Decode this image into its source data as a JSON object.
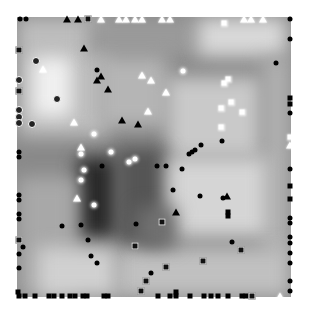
{
  "figure": {
    "plot_area": {
      "left": 17,
      "top": 17,
      "width": 274,
      "height": 280
    },
    "background_regions": [
      {
        "x": 0,
        "y": 0,
        "w": 90,
        "h": 120,
        "shade": "#bdbdbd"
      },
      {
        "x": 15,
        "y": 40,
        "w": 40,
        "h": 60,
        "shade": "#f0f0f0"
      },
      {
        "x": 70,
        "y": 0,
        "w": 110,
        "h": 40,
        "shade": "#9a9a9a"
      },
      {
        "x": 180,
        "y": 0,
        "w": 90,
        "h": 40,
        "shade": "#d8d8d8"
      },
      {
        "x": 80,
        "y": 40,
        "w": 70,
        "h": 70,
        "shade": "#b5b5b5"
      },
      {
        "x": 150,
        "y": 60,
        "w": 95,
        "h": 80,
        "shade": "#c9c9c9"
      },
      {
        "x": 245,
        "y": 40,
        "w": 29,
        "h": 200,
        "shade": "#b0b0b0"
      },
      {
        "x": 60,
        "y": 140,
        "w": 40,
        "h": 80,
        "shade": "#2a2a2a"
      },
      {
        "x": 100,
        "y": 130,
        "w": 50,
        "h": 110,
        "shade": "#555555"
      },
      {
        "x": 150,
        "y": 140,
        "w": 100,
        "h": 80,
        "shade": "#d5d5d5"
      },
      {
        "x": 0,
        "y": 160,
        "w": 60,
        "h": 120,
        "shade": "#a8a8a8"
      },
      {
        "x": 100,
        "y": 230,
        "w": 174,
        "h": 50,
        "shade": "#c0c0c0"
      },
      {
        "x": 20,
        "y": 230,
        "w": 80,
        "h": 50,
        "shade": "#d0d0d0"
      },
      {
        "x": 120,
        "y": 190,
        "w": 40,
        "h": 40,
        "shade": "#707070"
      }
    ],
    "markers": [
      {
        "type": "dot-black",
        "x": 20,
        "y": 19
      },
      {
        "type": "dot-black",
        "x": 26,
        "y": 19
      },
      {
        "type": "tri-black",
        "x": 67,
        "y": 19
      },
      {
        "type": "tri-black",
        "x": 78,
        "y": 19
      },
      {
        "type": "sq-ring",
        "x": 88,
        "y": 19
      },
      {
        "type": "tri-white",
        "x": 101,
        "y": 19
      },
      {
        "type": "tri-white",
        "x": 119,
        "y": 19
      },
      {
        "type": "tri-white",
        "x": 126,
        "y": 19
      },
      {
        "type": "tri-white",
        "x": 135,
        "y": 19
      },
      {
        "type": "tri-white",
        "x": 142,
        "y": 19
      },
      {
        "type": "tri-white",
        "x": 162,
        "y": 19
      },
      {
        "type": "tri-white",
        "x": 170,
        "y": 19
      },
      {
        "type": "sq-white",
        "x": 224,
        "y": 23
      },
      {
        "type": "tri-white",
        "x": 244,
        "y": 19
      },
      {
        "type": "tri-white",
        "x": 251,
        "y": 19
      },
      {
        "type": "tri-white",
        "x": 263,
        "y": 19
      },
      {
        "type": "dot-black",
        "x": 290,
        "y": 19
      },
      {
        "type": "dot-black",
        "x": 290,
        "y": 39
      },
      {
        "type": "sq-ring",
        "x": 19,
        "y": 50
      },
      {
        "type": "tri-black",
        "x": 84,
        "y": 48
      },
      {
        "type": "dot-ring",
        "x": 36,
        "y": 61
      },
      {
        "type": "tri-white",
        "x": 43,
        "y": 69
      },
      {
        "type": "dot-black",
        "x": 97,
        "y": 70
      },
      {
        "type": "tri-black",
        "x": 101,
        "y": 76
      },
      {
        "type": "tri-black",
        "x": 97,
        "y": 80
      },
      {
        "type": "tri-black",
        "x": 108,
        "y": 89
      },
      {
        "type": "dot-white",
        "x": 183,
        "y": 71
      },
      {
        "type": "tri-white",
        "x": 142,
        "y": 75
      },
      {
        "type": "tri-white",
        "x": 151,
        "y": 80
      },
      {
        "type": "dot-black",
        "x": 276,
        "y": 63
      },
      {
        "type": "dot-ring",
        "x": 19,
        "y": 80
      },
      {
        "type": "sq-ring",
        "x": 19,
        "y": 91
      },
      {
        "type": "sq-white",
        "x": 228,
        "y": 79
      },
      {
        "type": "sq-white",
        "x": 224,
        "y": 83
      },
      {
        "type": "tri-white",
        "x": 166,
        "y": 92
      },
      {
        "type": "dot-ring",
        "x": 57,
        "y": 99
      },
      {
        "type": "sq-white",
        "x": 231,
        "y": 102
      },
      {
        "type": "sq-white",
        "x": 221,
        "y": 108
      },
      {
        "type": "sq-white",
        "x": 242,
        "y": 112
      },
      {
        "type": "sq-black",
        "x": 290,
        "y": 98
      },
      {
        "type": "sq-black",
        "x": 290,
        "y": 104
      },
      {
        "type": "dot-ring",
        "x": 19,
        "y": 110
      },
      {
        "type": "tri-white",
        "x": 148,
        "y": 111
      },
      {
        "type": "dot-ring",
        "x": 19,
        "y": 117
      },
      {
        "type": "dot-ring",
        "x": 19,
        "y": 123
      },
      {
        "type": "dot-ring",
        "x": 32,
        "y": 124
      },
      {
        "type": "tri-white",
        "x": 74,
        "y": 122
      },
      {
        "type": "tri-black",
        "x": 122,
        "y": 120
      },
      {
        "type": "tri-black",
        "x": 138,
        "y": 124
      },
      {
        "type": "dot-white",
        "x": 94,
        "y": 134
      },
      {
        "type": "sq-white",
        "x": 221,
        "y": 127
      },
      {
        "type": "dot-black",
        "x": 290,
        "y": 113
      },
      {
        "type": "tri-white",
        "x": 81,
        "y": 147
      },
      {
        "type": "dot-white",
        "x": 81,
        "y": 154
      },
      {
        "type": "dot-white",
        "x": 111,
        "y": 152
      },
      {
        "type": "dot-black",
        "x": 222,
        "y": 141
      },
      {
        "type": "dot-black",
        "x": 201,
        "y": 145
      },
      {
        "type": "dot-black",
        "x": 195,
        "y": 150
      },
      {
        "type": "dot-black",
        "x": 192,
        "y": 152
      },
      {
        "type": "dot-black",
        "x": 189,
        "y": 154
      },
      {
        "type": "sq-white",
        "x": 290,
        "y": 137
      },
      {
        "type": "tri-white",
        "x": 290,
        "y": 145
      },
      {
        "type": "dot-white",
        "x": 129,
        "y": 162
      },
      {
        "type": "dot-white",
        "x": 135,
        "y": 159
      },
      {
        "type": "dot-black",
        "x": 102,
        "y": 166
      },
      {
        "type": "dot-black",
        "x": 19,
        "y": 152
      },
      {
        "type": "dot-black",
        "x": 19,
        "y": 157
      },
      {
        "type": "dot-white",
        "x": 84,
        "y": 170
      },
      {
        "type": "dot-white",
        "x": 81,
        "y": 180
      },
      {
        "type": "dot-black",
        "x": 182,
        "y": 169
      },
      {
        "type": "dot-black",
        "x": 157,
        "y": 166
      },
      {
        "type": "dot-black",
        "x": 166,
        "y": 166
      },
      {
        "type": "dot-black",
        "x": 290,
        "y": 169
      },
      {
        "type": "dot-black",
        "x": 19,
        "y": 195
      },
      {
        "type": "dot-black",
        "x": 19,
        "y": 200
      },
      {
        "type": "tri-white",
        "x": 77,
        "y": 198
      },
      {
        "type": "dot-white",
        "x": 94,
        "y": 205
      },
      {
        "type": "dot-black",
        "x": 173,
        "y": 190
      },
      {
        "type": "dot-black",
        "x": 200,
        "y": 196
      },
      {
        "type": "dot-black",
        "x": 223,
        "y": 198
      },
      {
        "type": "tri-black",
        "x": 227,
        "y": 196
      },
      {
        "type": "tri-black",
        "x": 176,
        "y": 212
      },
      {
        "type": "sq-black",
        "x": 228,
        "y": 212
      },
      {
        "type": "sq-black",
        "x": 228,
        "y": 216
      },
      {
        "type": "sq-black",
        "x": 290,
        "y": 186
      },
      {
        "type": "sq-black",
        "x": 290,
        "y": 199
      },
      {
        "type": "dot-black",
        "x": 290,
        "y": 218
      },
      {
        "type": "dot-black",
        "x": 290,
        "y": 223
      },
      {
        "type": "dot-black",
        "x": 19,
        "y": 214
      },
      {
        "type": "dot-black",
        "x": 19,
        "y": 219
      },
      {
        "type": "dot-black",
        "x": 136,
        "y": 224
      },
      {
        "type": "sq-ring",
        "x": 162,
        "y": 222
      },
      {
        "type": "dot-black",
        "x": 290,
        "y": 237
      },
      {
        "type": "dot-black",
        "x": 290,
        "y": 243
      },
      {
        "type": "dot-black",
        "x": 81,
        "y": 225
      },
      {
        "type": "dot-black",
        "x": 62,
        "y": 226
      },
      {
        "type": "sq-ring",
        "x": 19,
        "y": 240
      },
      {
        "type": "dot-black",
        "x": 23,
        "y": 247
      },
      {
        "type": "dot-black",
        "x": 88,
        "y": 240
      },
      {
        "type": "dot-black",
        "x": 232,
        "y": 242
      },
      {
        "type": "sq-ring",
        "x": 241,
        "y": 250
      },
      {
        "type": "sq-ring",
        "x": 135,
        "y": 246
      },
      {
        "type": "dot-black",
        "x": 290,
        "y": 253
      },
      {
        "type": "dot-black",
        "x": 19,
        "y": 254
      },
      {
        "type": "dot-black",
        "x": 91,
        "y": 256
      },
      {
        "type": "dot-black",
        "x": 97,
        "y": 263
      },
      {
        "type": "sq-ring",
        "x": 203,
        "y": 261
      },
      {
        "type": "dot-black",
        "x": 290,
        "y": 263
      },
      {
        "type": "dot-black",
        "x": 19,
        "y": 268
      },
      {
        "type": "sq-ring",
        "x": 166,
        "y": 267
      },
      {
        "type": "dot-black",
        "x": 151,
        "y": 273
      },
      {
        "type": "sq-ring",
        "x": 146,
        "y": 281
      },
      {
        "type": "dot-black",
        "x": 290,
        "y": 281
      },
      {
        "type": "sq-ring",
        "x": 141,
        "y": 291
      },
      {
        "type": "dot-black",
        "x": 290,
        "y": 291
      },
      {
        "type": "sq-black",
        "x": 18,
        "y": 292
      },
      {
        "type": "sq-black",
        "x": 19,
        "y": 296
      },
      {
        "type": "sq-black",
        "x": 25,
        "y": 296
      },
      {
        "type": "sq-black",
        "x": 35,
        "y": 296
      },
      {
        "type": "sq-black",
        "x": 49,
        "y": 296
      },
      {
        "type": "sq-black",
        "x": 54,
        "y": 296
      },
      {
        "type": "sq-black",
        "x": 62,
        "y": 296
      },
      {
        "type": "sq-black",
        "x": 70,
        "y": 296
      },
      {
        "type": "sq-black",
        "x": 75,
        "y": 296
      },
      {
        "type": "sq-black",
        "x": 83,
        "y": 296
      },
      {
        "type": "sq-black",
        "x": 87,
        "y": 296
      },
      {
        "type": "sq-black",
        "x": 104,
        "y": 296
      },
      {
        "type": "sq-black",
        "x": 108,
        "y": 296
      },
      {
        "type": "sq-black",
        "x": 158,
        "y": 296
      },
      {
        "type": "sq-black",
        "x": 170,
        "y": 296
      },
      {
        "type": "sq-black",
        "x": 176,
        "y": 292
      },
      {
        "type": "sq-black",
        "x": 176,
        "y": 296
      },
      {
        "type": "sq-black",
        "x": 190,
        "y": 296
      },
      {
        "type": "sq-black",
        "x": 204,
        "y": 296
      },
      {
        "type": "sq-black",
        "x": 211,
        "y": 296
      },
      {
        "type": "sq-black",
        "x": 218,
        "y": 296
      },
      {
        "type": "sq-black",
        "x": 228,
        "y": 296
      },
      {
        "type": "sq-black",
        "x": 242,
        "y": 296
      },
      {
        "type": "sq-black",
        "x": 246,
        "y": 296
      },
      {
        "type": "sq-ring",
        "x": 252,
        "y": 296
      },
      {
        "type": "tri-white",
        "x": 280,
        "y": 296
      }
    ]
  }
}
